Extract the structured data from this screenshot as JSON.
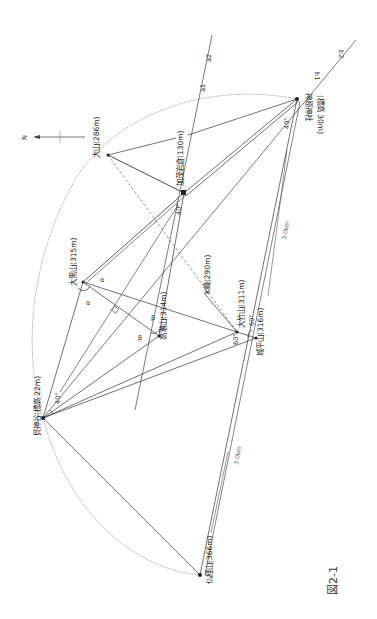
{
  "figure": {
    "caption": "図2-1",
    "north_label": "N"
  },
  "points": {
    "oyama": {
      "label": "大山(286m)",
      "x": 108,
      "y": 155
    },
    "kamo_iwakura": {
      "label": "加茂岩倉(130m)",
      "x": 184,
      "y": 193
    },
    "kanbara_jinja": {
      "label": "神原神社",
      "sub": "(標高 30m)",
      "x": 297,
      "y": 99
    },
    "daikoku": {
      "label": "大黒山(315m)",
      "x": 83,
      "y": 282
    },
    "takase": {
      "label": "高瀬山(314m)",
      "x": 159,
      "y": 336
    },
    "otake": {
      "label": "大竹山(311m)",
      "x": 237,
      "y": 332
    },
    "jogahira": {
      "label": "城平山(316m)",
      "x": 256,
      "y": 338
    },
    "kpeak": {
      "label": "K峰(290m)",
      "x": 204,
      "y": 290
    },
    "butsukyo": {
      "label": "仏経山(366m)",
      "x": 200,
      "y": 575
    },
    "kamidani": {
      "label": "貝神谷(標高 22m)",
      "x": 43,
      "y": 418
    }
  },
  "line_labels": {
    "a1": "a1",
    "a2": "a2",
    "b1": "b1",
    "b2": "b2"
  },
  "angles": {
    "kamidani": "40°",
    "kamo": "40°",
    "kanbara": "40°",
    "otake": "60°",
    "jogahira": "60°",
    "alpha": "α",
    "beta": "β"
  },
  "distances": {
    "upper": "3.0km",
    "lower": "3.0km"
  }
}
